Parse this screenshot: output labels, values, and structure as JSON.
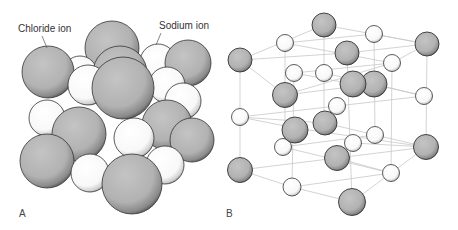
{
  "figure": {
    "panels": [
      {
        "id": "A",
        "label": "A",
        "description": "Space-filling model of NaCl crystal"
      },
      {
        "id": "B",
        "label": "B",
        "description": "Ball-and-stick lattice model of NaCl crystal"
      }
    ],
    "annotations": {
      "chloride": "Chloride ion",
      "sodium": "Sodium ion"
    },
    "legend": {
      "chloride_color": "#b4b4b4",
      "sodium_color": "#ffffff",
      "lattice_line_color": "#c8c8c8"
    }
  }
}
